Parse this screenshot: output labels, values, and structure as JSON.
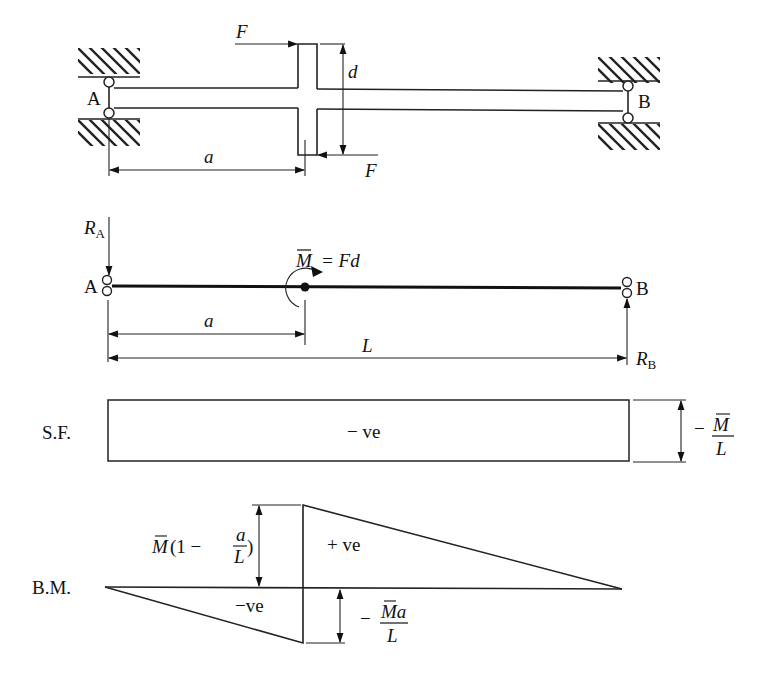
{
  "figure": {
    "top": {
      "support_left": "A",
      "support_right": "B",
      "force_label_top": "F",
      "force_label_bottom": "F",
      "bracket_height": "d",
      "distance_a": "a"
    },
    "middle": {
      "reaction_A": "R",
      "reaction_A_sub": "A",
      "reaction_B": "R",
      "reaction_B_sub": "B",
      "node_A": "A",
      "node_B": "B",
      "moment_symbol": "M",
      "moment_eq": "= Fd",
      "distance_a": "a",
      "span_L": "L"
    },
    "shear": {
      "label": "S.F.",
      "sign": "− ve",
      "value_prefix": "−",
      "value_num": "M",
      "value_den": "L"
    },
    "bending": {
      "label": "B.M.",
      "pos_sign": "+ ve",
      "neg_sign": "−ve",
      "upper_value_M": "M",
      "upper_value_rest": "(1  −",
      "upper_value_frac_num": "a",
      "upper_value_frac_den": "L",
      "upper_value_close": ")",
      "lower_value_prefix": "−",
      "lower_value_num": "Ma",
      "lower_value_den": "L"
    }
  }
}
